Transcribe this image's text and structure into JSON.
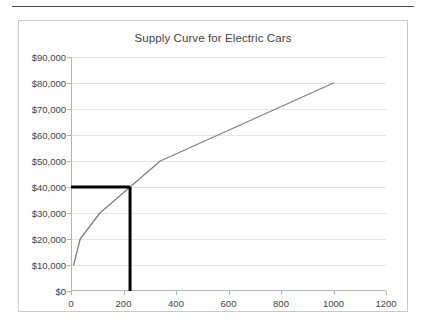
{
  "figure": {
    "has_top_rule": true,
    "border_color": "#c9c9c9"
  },
  "chart_data": {
    "type": "line",
    "title": "Supply Curve for Electric Cars",
    "xlabel": "",
    "ylabel": "",
    "xlim": [
      0,
      1200
    ],
    "ylim": [
      0,
      90000
    ],
    "grid": true,
    "legend": "none",
    "x_tick_labels": [
      "0",
      "200",
      "400",
      "600",
      "800",
      "1000",
      "1200"
    ],
    "x_tick_values": [
      0,
      200,
      400,
      600,
      800,
      1000,
      1200
    ],
    "y_tick_labels": [
      "$0",
      "$10,000",
      "$20,000",
      "$30,000",
      "$40,000",
      "$50,000",
      "$60,000",
      "$70,000",
      "$80,000",
      "$90,000"
    ],
    "y_tick_values": [
      0,
      10000,
      20000,
      30000,
      40000,
      50000,
      60000,
      70000,
      80000,
      90000
    ],
    "series": [
      {
        "name": "Supply",
        "color": "#808080",
        "x": [
          10,
          35,
          110,
          225,
          340,
          1000
        ],
        "values": [
          10000,
          20000,
          30000,
          40000,
          50000,
          80000
        ]
      }
    ],
    "annotations": [
      {
        "name": "equilibrium-price-line",
        "kind": "horizontal-marker",
        "color": "#000000",
        "y": 40000,
        "x_from": 0,
        "x_to": 225
      },
      {
        "name": "equilibrium-quantity-line",
        "kind": "vertical-marker",
        "color": "#000000",
        "x": 225,
        "y_from": 0,
        "y_to": 40000
      }
    ]
  }
}
